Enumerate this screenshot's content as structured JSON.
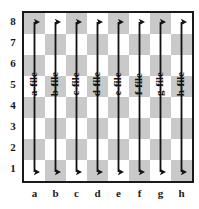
{
  "diagram": {
    "type": "chess-board-annotated",
    "board": {
      "files": [
        "a",
        "b",
        "c",
        "d",
        "e",
        "f",
        "g",
        "h"
      ],
      "ranks": [
        "8",
        "7",
        "6",
        "5",
        "4",
        "3",
        "2",
        "1"
      ],
      "square_count": 64,
      "light_color": "#ffffff",
      "dark_color": "#c9c9c9",
      "border_color": "#1a1a1a",
      "top_left_square_shade": "dark"
    },
    "annotations": {
      "arrow_color": "#111111",
      "arrow_style": "double-headed-vertical",
      "arrow_count": 8,
      "captions": [
        "a-file",
        "b-file",
        "c-file",
        "d-file",
        "e-file",
        "f-file",
        "g-file",
        "h-file"
      ],
      "caption_rotation": "-90deg"
    }
  },
  "chart_data": {
    "type": "diagram",
    "xlabel": "",
    "ylabel": "",
    "categories": [
      "a",
      "b",
      "c",
      "d",
      "e",
      "f",
      "g",
      "h"
    ],
    "series": [
      {
        "name": "file-arrows",
        "values": [
          8,
          8,
          8,
          8,
          8,
          8,
          8,
          8
        ],
        "labels": [
          "a-file",
          "b-file",
          "c-file",
          "d-file",
          "e-file",
          "f-file",
          "g-file",
          "h-file"
        ]
      }
    ],
    "x": [
      "a",
      "b",
      "c",
      "d",
      "e",
      "f",
      "g",
      "h"
    ],
    "y": [
      "1",
      "2",
      "3",
      "4",
      "5",
      "6",
      "7",
      "8"
    ],
    "xlim": [
      "a",
      "h"
    ],
    "ylim": [
      1,
      8
    ],
    "grid": true,
    "legend": "none"
  }
}
